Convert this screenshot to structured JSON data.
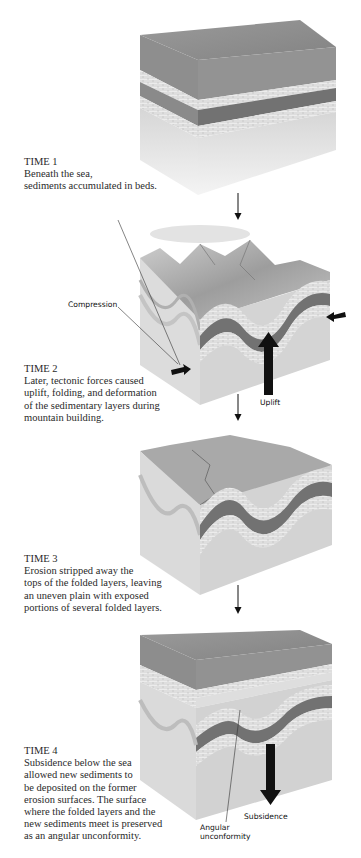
{
  "figure": {
    "stages": [
      {
        "title": "TIME 1",
        "lines": [
          "Beneath the sea,",
          "sediments accumulated in beds."
        ]
      },
      {
        "title": "TIME 2",
        "lines": [
          "Later, tectonic forces caused",
          "uplift, folding, and deformation",
          "of the sedimentary layers during",
          "mountain building."
        ],
        "labels": {
          "compression": "Compression",
          "uplift": "Uplift"
        }
      },
      {
        "title": "TIME 3",
        "lines": [
          "Erosion stripped away the",
          "tops of the folded layers, leaving",
          "an uneven plain with exposed",
          "portions of several folded layers."
        ]
      },
      {
        "title": "TIME 4",
        "lines": [
          "Subsidence below the sea",
          "allowed new sediments to",
          "be deposited on the former",
          "erosion surfaces. The surface",
          "where the folded layers and the",
          "new sediments meet is preserved",
          "as an angular unconformity."
        ],
        "labels": {
          "subsidence": "Subsidence",
          "angular_line1": "Angular",
          "angular_line2": "unconformity"
        }
      }
    ],
    "colors": {
      "sea": "#8f8f8f",
      "dark_layer": "#6e6e6e",
      "light_layer": "#e6e6e6",
      "base_rock": "#d2d2d2",
      "text": "#2a2a2a",
      "arrow": "#111111"
    }
  }
}
